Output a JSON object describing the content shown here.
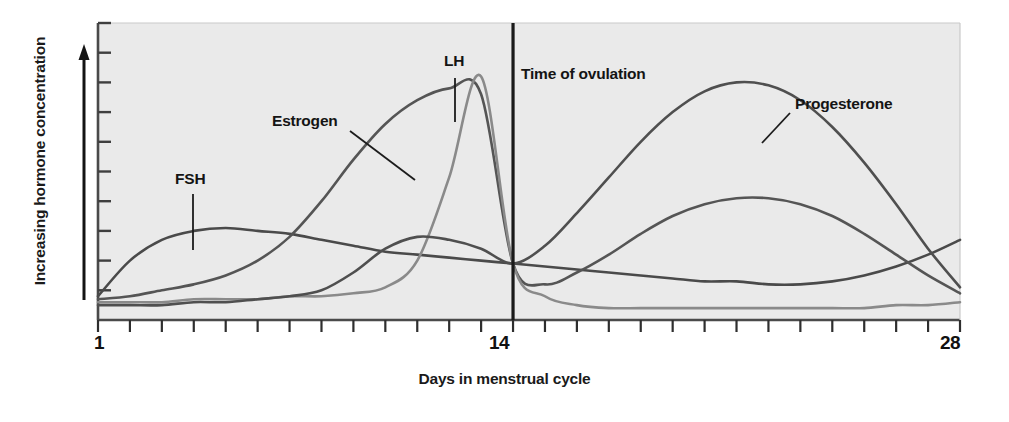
{
  "chart_data": {
    "type": "line",
    "title": "",
    "xlabel": "Days in menstrual cycle",
    "ylabel": "Increasing hormone concentration",
    "xlim": [
      1,
      28
    ],
    "ylim": [
      0,
      100
    ],
    "grid": false,
    "legend": "inline-annotations",
    "x_tick_labels": [
      "1",
      "14",
      "28"
    ],
    "x_tick_count": 28,
    "y_tick_count": 11,
    "y_tick_labels": [],
    "annotations": [
      {
        "text": "FSH",
        "x": 4.2,
        "y": 45,
        "series": "FSH"
      },
      {
        "text": "Estrogen",
        "x": 7.8,
        "y": 76,
        "series": "Estrogen"
      },
      {
        "text": "LH",
        "x": 12.3,
        "y": 93,
        "series": "LH"
      },
      {
        "text": "Time of ovulation",
        "x": 15.2,
        "y": 88,
        "series": "ovulation-marker"
      },
      {
        "text": "Progesterone",
        "x": 22.6,
        "y": 80,
        "series": "Progesterone"
      }
    ],
    "markers": [
      {
        "name": "Time of ovulation",
        "type": "vertical-line",
        "x": 14,
        "color": "#1a1a1a"
      }
    ],
    "x": [
      1,
      2,
      3,
      4,
      5,
      6,
      7,
      8,
      9,
      10,
      11,
      12,
      13,
      14,
      15,
      16,
      17,
      18,
      19,
      20,
      21,
      22,
      23,
      24,
      25,
      26,
      27,
      28
    ],
    "series": [
      {
        "name": "FSH",
        "color": "#4a4a4a",
        "values": [
          8,
          20,
          27,
          30,
          31,
          30,
          29,
          27,
          25,
          23,
          22,
          21,
          20,
          19,
          18,
          17,
          16,
          15,
          14,
          13,
          13,
          12,
          12,
          13,
          15,
          18,
          22,
          27
        ]
      },
      {
        "name": "Estrogen",
        "color": "#555555",
        "values": [
          7,
          8,
          10,
          12,
          15,
          20,
          28,
          40,
          54,
          66,
          74,
          78,
          76,
          19,
          12,
          16,
          22,
          29,
          35,
          39,
          41,
          41,
          39,
          35,
          29,
          22,
          15,
          9
        ]
      },
      {
        "name": "LH",
        "color": "#8a8a8a",
        "values": [
          6,
          6,
          6,
          7,
          7,
          7,
          8,
          8,
          9,
          11,
          20,
          48,
          82,
          19,
          8,
          5,
          4,
          4,
          4,
          4,
          4,
          4,
          4,
          4,
          4,
          5,
          5,
          6
        ]
      },
      {
        "name": "Progesterone",
        "color": "#4f4f4f",
        "values": [
          5,
          5,
          5,
          6,
          6,
          7,
          8,
          10,
          16,
          24,
          28,
          27,
          24,
          19,
          25,
          36,
          48,
          60,
          70,
          77,
          80,
          79,
          74,
          65,
          53,
          39,
          24,
          11
        ]
      }
    ]
  },
  "axis": {
    "x_label_1": "1",
    "x_label_14": "14",
    "x_label_28": "28",
    "x_title": "Days in menstrual cycle",
    "y_title": "Increasing hormone concentration"
  },
  "labels": {
    "fsh": "FSH",
    "estrogen": "Estrogen",
    "lh": "LH",
    "ovulation": "Time of ovulation",
    "progesterone": "Progesterone"
  },
  "colors": {
    "plot_background": "#eaeaea",
    "axis": "#3a3a3a",
    "text": "#141414",
    "fsh": "#4a4a4a",
    "estrogen": "#555555",
    "lh": "#8a8a8a",
    "progesterone": "#4f4f4f",
    "ovulation_line": "#1a1a1a"
  }
}
